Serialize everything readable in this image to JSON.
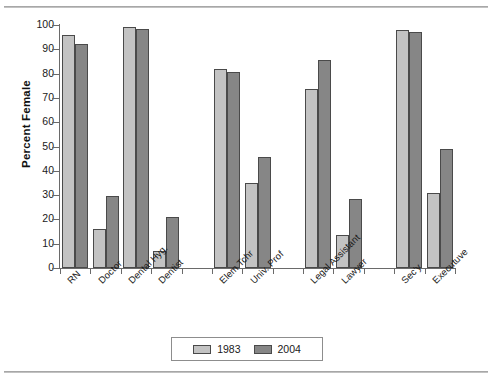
{
  "chart_data": {
    "type": "bar",
    "title": "",
    "xlabel": "",
    "ylabel": "Percent Female",
    "ylim": [
      0,
      100
    ],
    "ytick_labels": [
      "100",
      "90",
      "80",
      "70",
      "60",
      "50",
      "40",
      "30",
      "20",
      "10",
      "0"
    ],
    "ytick_values": [
      100,
      90,
      80,
      70,
      60,
      50,
      40,
      30,
      20,
      10,
      0
    ],
    "grid": false,
    "legend_position": "bottom-center",
    "categories": [
      "RN",
      "Doctor",
      "Dental Hyg.",
      "Dentist",
      "Elem Tchr",
      "Univ. Prof",
      "Legal Assistant",
      "Lawyer",
      "Sec'y",
      "Executuve"
    ],
    "groups": [
      [
        "RN",
        "Doctor",
        "Dental Hyg.",
        "Dentist"
      ],
      [
        "Elem Tchr",
        "Univ. Prof"
      ],
      [
        "Legal Assistant",
        "Lawyer"
      ],
      [
        "Sec'y",
        "Executuve"
      ]
    ],
    "series": [
      {
        "name": "1983",
        "color": "#c3c3c3",
        "values": [
          96,
          16,
          99,
          7,
          82,
          35,
          73.5,
          13.5,
          98,
          31
        ]
      },
      {
        "name": "2004",
        "color": "#868686",
        "values": [
          92,
          29.5,
          98.5,
          21,
          80.5,
          45.5,
          85.5,
          28.5,
          97,
          49
        ]
      }
    ]
  },
  "legend": {
    "items": [
      {
        "label": "1983",
        "color": "#c3c3c3"
      },
      {
        "label": "2004",
        "color": "#868686"
      }
    ]
  }
}
